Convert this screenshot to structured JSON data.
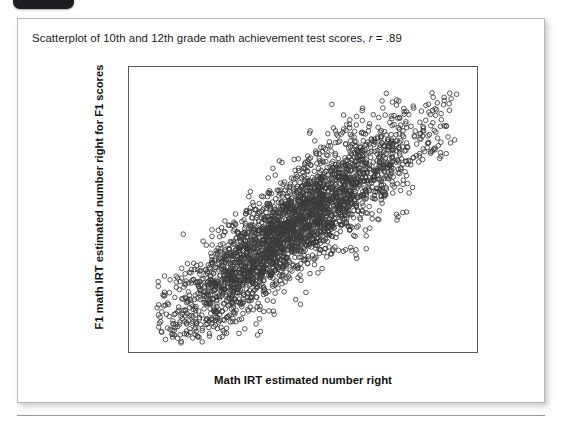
{
  "badge": {
    "name": "corner-tab"
  },
  "figure": {
    "caption_prefix": "Scatterplot of 10th and 12th grade math achievement test scores, ",
    "caption_stat_symbol": "r",
    "caption_stat_value": " = .89"
  },
  "chart_data": {
    "type": "scatter",
    "title": "Scatterplot of 10th and 12th grade math achievement test scores, r = .89",
    "xlabel": "Math IRT estimated number right",
    "ylabel": "F1 math IRT estimated number right for F1 scores",
    "xlim": [
      5,
      75
    ],
    "ylim": [
      10,
      90
    ],
    "xticks": [
      10,
      20,
      30,
      40,
      50,
      60,
      70
    ],
    "yticks": [
      20,
      40,
      60,
      80
    ],
    "grid": false,
    "legend": null,
    "correlation": 0.89,
    "n_points": 3000,
    "marker": "open-circle",
    "marker_size_px": 4.6,
    "marker_color": "#3a3a3a",
    "point_stats": {
      "x_mean": 37.5,
      "x_sd": 12.6,
      "y_mean": 45.0,
      "y_sd": 15.6,
      "x_min": 10.5,
      "x_max": 71.0,
      "y_min": 13.0,
      "y_max": 84.0
    }
  },
  "axes": {
    "y_ticks": [
      "80",
      "60",
      "40",
      "20"
    ],
    "x_ticks": [
      "10",
      "20",
      "30",
      "40",
      "50",
      "60",
      "70"
    ],
    "x_title": "Math IRT estimated number right",
    "y_title": "F1 math IRT estimated number right for F1 scores"
  },
  "colors": {
    "card_border": "#b9b9b9",
    "frame": "#5a5a5a",
    "marker": "#3a3a3a",
    "text": "#1a1a1a",
    "badge": "#1d1d1f",
    "rule": "#9a9a9a"
  }
}
